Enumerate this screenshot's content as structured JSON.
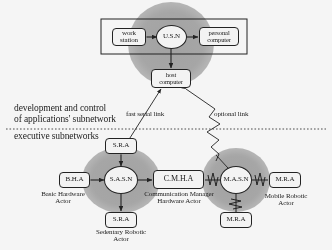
{
  "diagram": {
    "colors": {
      "cloud_fill": "#a8a8a8",
      "node_stroke": "#1b1b1b",
      "node_fill": "#fdfdfd",
      "text": "#141414",
      "background": "#ffffff"
    },
    "regions": [
      {
        "id": "usn-cloud",
        "label": "U.S.N network cloud"
      },
      {
        "id": "sasn-cloud",
        "label": "S.A.S.N network cloud"
      },
      {
        "id": "masn-cloud",
        "label": "M.A.S.N network cloud"
      }
    ],
    "nodes": [
      {
        "id": "work-station",
        "label": "work station",
        "shape": "rounded-box"
      },
      {
        "id": "usn",
        "label": "U.S.N",
        "shape": "circle"
      },
      {
        "id": "personal-computer",
        "label": "personal computer",
        "shape": "rounded-box"
      },
      {
        "id": "host-computer",
        "label": "host computer",
        "shape": "rounded-box"
      },
      {
        "id": "sra-top",
        "label": "S.R.A",
        "shape": "rounded-box"
      },
      {
        "id": "bha",
        "label": "B.H.A",
        "shape": "rounded-box"
      },
      {
        "id": "sasn",
        "label": "S.A.S.N",
        "shape": "circle"
      },
      {
        "id": "cmha",
        "label": "C.M.H.A",
        "shape": "rounded-box"
      },
      {
        "id": "masn",
        "label": "M.A.S.N",
        "shape": "circle"
      },
      {
        "id": "mra-right",
        "label": "M.R.A",
        "shape": "rounded-box"
      },
      {
        "id": "sra-bottom",
        "label": "S.R.A",
        "shape": "rounded-box"
      },
      {
        "id": "mra-bottom",
        "label": "M.R.A",
        "shape": "rounded-box"
      }
    ],
    "captions": [
      {
        "id": "bha-caption",
        "line1": "Basic Hardware",
        "line2": "Actor"
      },
      {
        "id": "cmha-caption",
        "line1": "Communication Manager",
        "line2": "Hardware Actor"
      },
      {
        "id": "mra-caption",
        "line1": "Mobile Robotic",
        "line2": "Actor"
      },
      {
        "id": "sra-caption",
        "line1": "Sedentary Robotic",
        "line2": "Actor"
      }
    ],
    "link_labels": [
      {
        "id": "fast-serial-link",
        "text": "fast serial link"
      },
      {
        "id": "optional-link",
        "text": "optional link"
      }
    ],
    "zone_labels": {
      "upper_line1": "development and control",
      "upper_line2": "of applications' subnetwork",
      "lower_line1": "executive subnetworks"
    }
  }
}
